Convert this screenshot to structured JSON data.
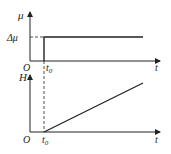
{
  "top_graph": {
    "y_label": "μ",
    "level_label": "Δμ",
    "origin": "O",
    "x_label": "t",
    "step_label": "t",
    "step_sub": "0"
  },
  "bottom_graph": {
    "y_label": "H",
    "origin": "O",
    "x_label": "t",
    "start_label": "t",
    "start_sub": "0"
  },
  "colors": {
    "line": "#222222"
  }
}
